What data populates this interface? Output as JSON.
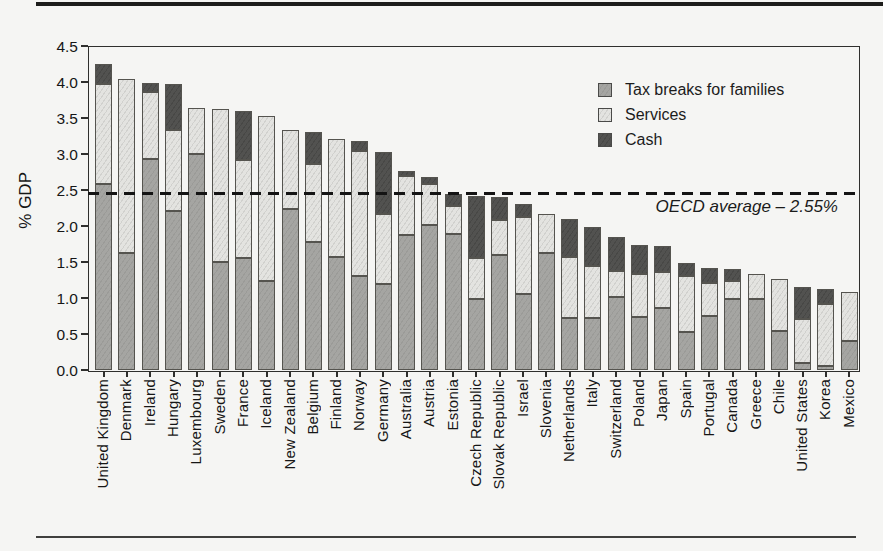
{
  "figure": {
    "type": "scanned book figure",
    "background_color": "#f5f5f3",
    "rule_color": "#1d1d1b"
  },
  "chart_data": {
    "type": "bar",
    "subtype": "stacked_vertical",
    "title": "",
    "xlabel": "",
    "ylabel": "% GDP",
    "ylim": [
      0,
      4.5
    ],
    "ytick_step": 0.5,
    "grid": false,
    "legend_position": "top-right",
    "bar_outline_color": "#55544f",
    "categories": [
      "United Kingdom",
      "Denmark",
      "Ireland",
      "Hungary",
      "Luxembourg",
      "Sweden",
      "France",
      "Iceland",
      "New Zealand",
      "Belgium",
      "Finland",
      "Norway",
      "Germany",
      "Australia",
      "Austria",
      "Estonia",
      "Czech Republic",
      "Slovak Republic",
      "Israel",
      "Slovenia",
      "Netherlands",
      "Italy",
      "Switzerland",
      "Poland",
      "Japan",
      "Spain",
      "Portugal",
      "Canada",
      "Greece",
      "Chile",
      "United States",
      "Korea",
      "Mexico"
    ],
    "series": [
      {
        "name": "Tax breaks for families",
        "color": "#a0a09d",
        "stack_order": "bottom",
        "values": [
          2.59,
          1.63,
          2.93,
          2.21,
          3.0,
          1.5,
          1.56,
          1.24,
          2.23,
          1.78,
          1.57,
          1.3,
          1.19,
          1.88,
          2.01,
          1.89,
          0.99,
          1.6,
          1.06,
          1.63,
          0.72,
          0.72,
          1.02,
          0.74,
          0.86,
          0.53,
          0.75,
          0.98,
          0.98,
          0.54,
          0.1,
          0.06,
          0.4
        ]
      },
      {
        "name": "Services",
        "color": "#dcdcd9",
        "stack_order": "middle",
        "values": [
          1.38,
          2.41,
          0.93,
          1.12,
          0.64,
          2.12,
          1.35,
          2.29,
          1.1,
          1.08,
          1.64,
          1.74,
          0.98,
          0.82,
          0.57,
          0.39,
          0.57,
          0.48,
          1.07,
          0.53,
          0.85,
          0.73,
          0.35,
          0.59,
          0.5,
          0.77,
          0.46,
          0.25,
          0.35,
          0.72,
          0.61,
          0.85,
          0.69
        ]
      },
      {
        "name": "Cash",
        "color": "#4e4e4c",
        "stack_order": "top",
        "values": [
          0.28,
          0,
          0.13,
          0.64,
          0,
          0,
          0.69,
          0,
          0,
          0.45,
          0,
          0.14,
          0.86,
          0.07,
          0.1,
          0.16,
          0.86,
          0.32,
          0.18,
          0,
          0.53,
          0.54,
          0.48,
          0.4,
          0.36,
          0.19,
          0.2,
          0.17,
          0,
          0,
          0.44,
          0.21,
          0
        ]
      }
    ],
    "totals": [
      4.25,
      4.04,
      3.99,
      3.97,
      3.64,
      3.62,
      3.6,
      3.53,
      3.33,
      3.31,
      3.21,
      3.18,
      3.03,
      2.77,
      2.68,
      2.44,
      2.42,
      2.4,
      2.31,
      2.16,
      2.1,
      1.99,
      1.85,
      1.73,
      1.72,
      1.49,
      1.41,
      1.4,
      1.33,
      1.26,
      1.15,
      1.12,
      1.09
    ],
    "y_tick_labels": [
      "0.0",
      "0.5",
      "1.0",
      "1.5",
      "2.0",
      "2.5",
      "3.0",
      "3.5",
      "4.0",
      "4.5"
    ],
    "reference_line": {
      "value": 2.45,
      "style": "dashed",
      "color": "#141414",
      "label": "OECD average – 2.55%"
    }
  }
}
